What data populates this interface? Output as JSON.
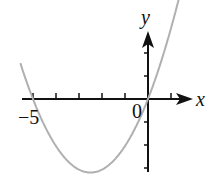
{
  "chart_data": {
    "type": "line",
    "title": "",
    "xlabel": "x",
    "ylabel": "y",
    "function": "y = a*x*(x+5), a ≈ 0.51",
    "roots": [
      -5,
      0
    ],
    "vertex": [
      -2.5,
      -3.2
    ],
    "x": [
      -5.5,
      -5,
      -4,
      -3,
      -2.5,
      -2,
      -1,
      0,
      1,
      1.6
    ],
    "series": [
      {
        "name": "parabola",
        "values": [
          1.4,
          0,
          -2.04,
          -3.06,
          -3.19,
          -3.06,
          -2.04,
          0,
          3.06,
          5.4
        ]
      }
    ],
    "tick_labels": {
      "x": [
        "-5",
        "0"
      ]
    },
    "xlim": [
      -5.7,
      2.2
    ],
    "ylim": [
      -3.4,
      3.6
    ],
    "grid": false,
    "legend": "none",
    "curve_color": "#b0b0b0",
    "axis_color": "#111111"
  },
  "labels": {
    "x_axis": "x",
    "y_axis": "y",
    "origin": "0",
    "neg_five": "−5"
  }
}
